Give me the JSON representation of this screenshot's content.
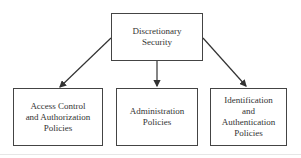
{
  "diagram": {
    "root": {
      "label": "Discretionary\nSecurity"
    },
    "children": [
      {
        "label": "Access Control\nand Authorization\nPolicies"
      },
      {
        "label": "Administration\nPolicies"
      },
      {
        "label": "Identification\nand\nAuthentication\nPolicies"
      }
    ],
    "edges": [
      {
        "from": "Discretionary Security",
        "to": "Access Control and Authorization Policies"
      },
      {
        "from": "Discretionary Security",
        "to": "Administration Policies"
      },
      {
        "from": "Discretionary Security",
        "to": "Identification and Authentication Policies"
      }
    ]
  }
}
